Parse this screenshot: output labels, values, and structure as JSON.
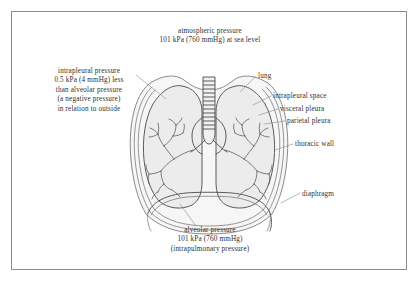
{
  "figure": {
    "frame_color": "#8b8b8b",
    "background": "#ffffff",
    "line_color": "#4a4a4a",
    "lung_fill": "#ececec",
    "pleura_fill": "#f4f4f4",
    "text_color": "#2f2f2f"
  },
  "labels": {
    "atmospheric_pressure": "atmospheric pressure\n101 kPa (760 mmHg) at sea level",
    "intrapleural_pressure": "intrapleural pressure\n0.5 kPa (4 mmHg) less\nthan alveolar pressure\n(a negative pressure)\nin relation to outside",
    "lung": "lung",
    "intrapleural_space": "intrapleural space",
    "visceral_pleura": "visceral pleura",
    "parietal_pleura": "parietal pleura",
    "thoracic_wall": "thoracic wall",
    "diaphragm": "diaphragm",
    "alveolar_pressure": "alveolar pressure\n101 kPa (760 mmHg)\n(intrapulmonary pressure)"
  },
  "values": {
    "atmospheric_kpa": "101 kPa",
    "atmospheric_mmhg": "760 mmHg",
    "intrapleural_delta_kpa": "0.5 kPa",
    "intrapleural_delta_mmhg": "4 mmHg",
    "alveolar_kpa": "101 kPa",
    "alveolar_mmhg": "760 mmHg"
  },
  "parts": [
    "trachea",
    "left lung",
    "right lung",
    "bronchial tree",
    "diaphragm",
    "thoracic wall",
    "visceral pleura",
    "parietal pleura",
    "intrapleural space"
  ]
}
